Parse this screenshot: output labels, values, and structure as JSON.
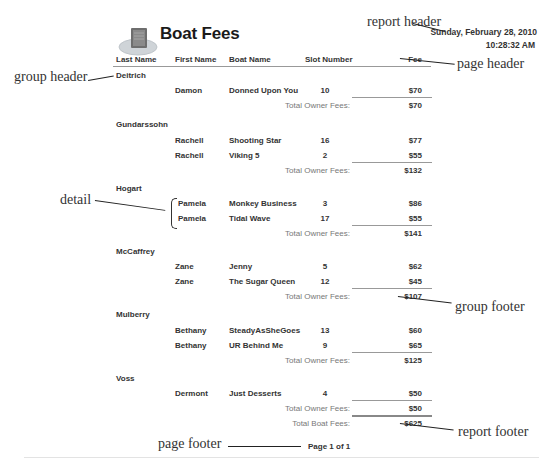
{
  "report": {
    "title": "Boat Fees",
    "icon": "report-book-icon",
    "date": "Sunday, February 28, 2010",
    "time": "10:28:32 AM",
    "columns": [
      "Last Name",
      "First Name",
      "Boat Name",
      "Slot Number",
      "Fee"
    ],
    "group_total_label": "Total Owner Fees:",
    "groups": [
      {
        "last_name": "Deitrich",
        "rows": [
          {
            "first": "Damon",
            "boat": "Donned Upon You",
            "slot": "10",
            "fee": "$70"
          }
        ],
        "total": "$70"
      },
      {
        "last_name": "Gundarssohn",
        "rows": [
          {
            "first": "Rachell",
            "boat": "Shooting Star",
            "slot": "16",
            "fee": "$77"
          },
          {
            "first": "Rachell",
            "boat": "Viking 5",
            "slot": "2",
            "fee": "$55"
          }
        ],
        "total": "$132"
      },
      {
        "last_name": "Hogart",
        "rows": [
          {
            "first": "Pamela",
            "boat": "Monkey Business",
            "slot": "3",
            "fee": "$86"
          },
          {
            "first": "Pamela",
            "boat": "Tidal Wave",
            "slot": "17",
            "fee": "$55"
          }
        ],
        "total": "$141"
      },
      {
        "last_name": "McCaffrey",
        "rows": [
          {
            "first": "Zane",
            "boat": "Jenny",
            "slot": "5",
            "fee": "$62"
          },
          {
            "first": "Zane",
            "boat": "The Sugar Queen",
            "slot": "12",
            "fee": "$45"
          }
        ],
        "total": "$107"
      },
      {
        "last_name": "Mulberry",
        "rows": [
          {
            "first": "Bethany",
            "boat": "SteadyAsSheGoes",
            "slot": "13",
            "fee": "$60"
          },
          {
            "first": "Bethany",
            "boat": "UR Behind Me",
            "slot": "9",
            "fee": "$65"
          }
        ],
        "total": "$125"
      },
      {
        "last_name": "Voss",
        "rows": [
          {
            "first": "Dermont",
            "boat": "Just Desserts",
            "slot": "4",
            "fee": "$50"
          }
        ],
        "total": "$50"
      }
    ],
    "grand_total_label": "Total Boat Fees:",
    "grand_total": "$625",
    "page_footer": "Page 1 of 1"
  },
  "annotations": {
    "report_header": "report header",
    "page_header": "page header",
    "group_header": "group header",
    "detail": "detail",
    "group_footer": "group footer",
    "report_footer": "report footer",
    "page_footer": "page footer"
  }
}
